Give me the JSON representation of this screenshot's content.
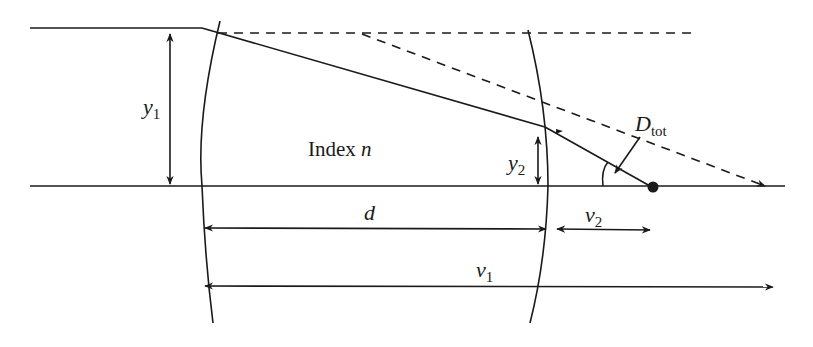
{
  "diagram": {
    "labels": {
      "y1": {
        "symbol": "y",
        "subscript": "1"
      },
      "y2": {
        "symbol": "y",
        "subscript": "2"
      },
      "index": {
        "text": "Index ",
        "symbol": "n"
      },
      "d": {
        "symbol": "d"
      },
      "v2": {
        "symbol": "v",
        "subscript": "2"
      },
      "v1": {
        "symbol": "v",
        "subscript": "1"
      },
      "dtot": {
        "symbol": "D",
        "subscript": "tot"
      }
    },
    "colors": {
      "stroke": "#1a1a1a",
      "background": "#ffffff"
    }
  }
}
